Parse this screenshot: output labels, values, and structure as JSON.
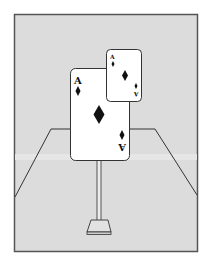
{
  "scene": {
    "description": "Two ace of diamonds cards mounted on a stand inside a room",
    "colors": {
      "background": "#ffffff",
      "room_fill": "#dcdcdc",
      "frame_stroke": "#555555",
      "line": "#333333",
      "card_fill": "#ffffff",
      "ink": "#111111"
    },
    "large_card": {
      "rank": "A",
      "suit": "diamond",
      "rank_inverted": "A"
    },
    "small_card": {
      "rank": "A",
      "suit": "diamond",
      "rank_inverted": "A"
    }
  }
}
